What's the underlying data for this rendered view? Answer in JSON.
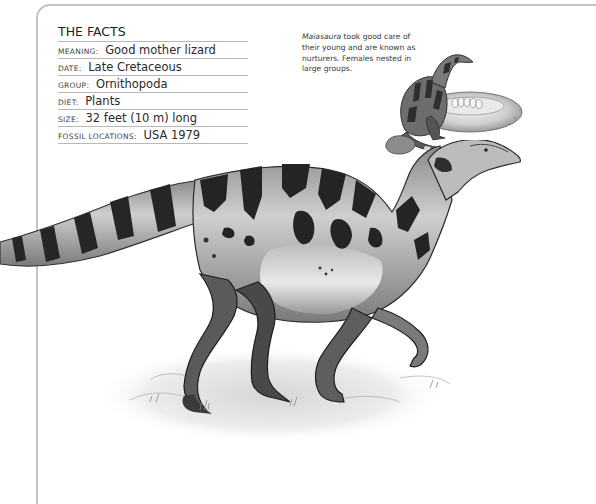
{
  "facts": {
    "title": "THE FACTS",
    "rows": [
      {
        "label": "MEANING:",
        "value": "Good mother lizard"
      },
      {
        "label": "DATE:",
        "value": "Late Cretaceous"
      },
      {
        "label": "GROUP:",
        "value": "Ornithopoda"
      },
      {
        "label": "DIET:",
        "value": "Plants"
      },
      {
        "label": "SIZE:",
        "value": "32 feet (10 m) long"
      },
      {
        "label": "FOSSIL LOCATIONS:",
        "value": "USA 1979"
      }
    ]
  },
  "caption": {
    "species": "Maiasaura",
    "text": " took good care of their young and are known as nurturers. Females nested in large groups."
  },
  "illustrations": {
    "nest_scene": "maiasaura-on-nest-illustration",
    "main": "maiasaura-walking-illustration"
  },
  "colors": {
    "frame": "#c4c4c4",
    "rule": "#b8b8b8",
    "text": "#2a2a2a"
  }
}
